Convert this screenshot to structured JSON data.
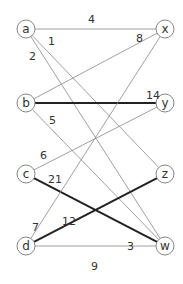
{
  "graph": {
    "type": "bipartite-weighted",
    "nodes": [
      {
        "id": "a",
        "label": "a",
        "x": 26,
        "y": 29
      },
      {
        "id": "b",
        "label": "b",
        "x": 26,
        "y": 103
      },
      {
        "id": "c",
        "label": "c",
        "x": 26,
        "y": 174
      },
      {
        "id": "d",
        "label": "d",
        "x": 26,
        "y": 246
      },
      {
        "id": "x",
        "label": "x",
        "x": 165,
        "y": 29
      },
      {
        "id": "y",
        "label": "y",
        "x": 165,
        "y": 103
      },
      {
        "id": "z",
        "label": "z",
        "x": 165,
        "y": 174
      },
      {
        "id": "w",
        "label": "w",
        "x": 165,
        "y": 246
      }
    ],
    "edges": [
      {
        "from": "a",
        "to": "x",
        "bold": false
      },
      {
        "from": "a",
        "to": "z",
        "bold": false
      },
      {
        "from": "a",
        "to": "w",
        "bold": false
      },
      {
        "from": "b",
        "to": "x",
        "bold": false
      },
      {
        "from": "b",
        "to": "y",
        "bold": true
      },
      {
        "from": "b",
        "to": "w",
        "bold": false
      },
      {
        "from": "c",
        "to": "y",
        "bold": false
      },
      {
        "from": "c",
        "to": "w",
        "bold": true
      },
      {
        "from": "d",
        "to": "x",
        "bold": false
      },
      {
        "from": "d",
        "to": "z",
        "bold": true
      },
      {
        "from": "d",
        "to": "w",
        "bold": false
      }
    ],
    "weight_labels": [
      {
        "text": "4",
        "x": 88,
        "y": 23
      },
      {
        "text": "1",
        "x": 48,
        "y": 45
      },
      {
        "text": "2",
        "x": 29,
        "y": 60
      },
      {
        "text": "8",
        "x": 136,
        "y": 42
      },
      {
        "text": "14",
        "x": 146,
        "y": 99
      },
      {
        "text": "5",
        "x": 49,
        "y": 124
      },
      {
        "text": "6",
        "x": 40,
        "y": 159
      },
      {
        "text": "21",
        "x": 48,
        "y": 183
      },
      {
        "text": "12",
        "x": 62,
        "y": 225
      },
      {
        "text": "7",
        "x": 32,
        "y": 231
      },
      {
        "text": "3",
        "x": 127,
        "y": 250
      },
      {
        "text": "9",
        "x": 91,
        "y": 270
      }
    ]
  }
}
